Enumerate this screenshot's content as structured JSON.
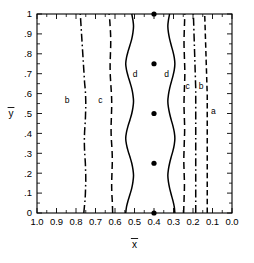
{
  "chart_data": {
    "type": "line",
    "title": "",
    "subtitle": "",
    "xlabel": "x̄",
    "ylabel": "ȳ",
    "xlabel_base": "x",
    "ylabel_base": "y",
    "xlim": [
      1.0,
      0.0
    ],
    "ylim": [
      0.0,
      1.0
    ],
    "x_axis_reversed": true,
    "grid": false,
    "legend": "inline-curve-labels",
    "xticks": [
      1.0,
      0.9,
      0.8,
      0.7,
      0.6,
      0.5,
      0.4,
      0.3,
      0.2,
      0.1,
      0.0
    ],
    "xtick_labels": [
      "1.0",
      "0.9",
      "0.8",
      "0.7",
      "0.6",
      "0.5",
      "0.4",
      "0.3",
      "0.2",
      "0.1",
      "0.0"
    ],
    "yticks": [
      0.0,
      0.1,
      0.2,
      0.3,
      0.4,
      0.5,
      0.6,
      0.7,
      0.8,
      0.9,
      1.0
    ],
    "ytick_labels": [
      "0",
      ".1",
      ".2",
      ".3",
      ".4",
      ".5",
      ".6",
      ".7",
      ".8",
      ".9",
      "1"
    ],
    "annotations": [
      {
        "text": "b",
        "x": 0.845,
        "y": 0.555,
        "name": "curve-label-b-left"
      },
      {
        "text": "c",
        "x": 0.675,
        "y": 0.555,
        "name": "curve-label-c-left"
      },
      {
        "text": "d",
        "x": 0.497,
        "y": 0.685,
        "name": "curve-label-d-left"
      },
      {
        "text": "d",
        "x": 0.335,
        "y": 0.685,
        "name": "curve-label-d-right"
      },
      {
        "text": "c",
        "x": 0.228,
        "y": 0.625,
        "name": "curve-label-c-right"
      },
      {
        "text": "b",
        "x": 0.158,
        "y": 0.625,
        "name": "curve-label-b-right"
      },
      {
        "text": "a",
        "x": 0.095,
        "y": 0.5,
        "name": "curve-label-a-right"
      }
    ],
    "points": {
      "name": "data-points",
      "marker": "filled-circle",
      "x": [
        0.4,
        0.4,
        0.4,
        0.4,
        0.4
      ],
      "y": [
        0.0,
        0.25,
        0.5,
        0.75,
        1.0
      ]
    },
    "series": [
      {
        "name": "b-left",
        "label": "b",
        "style": "dash-dot",
        "x": [
          0.76,
          0.757,
          0.754,
          0.752,
          0.751,
          0.75,
          0.75,
          0.751,
          0.752,
          0.754,
          0.756,
          0.757,
          0.757,
          0.756,
          0.754,
          0.752,
          0.751,
          0.75,
          0.75,
          0.751,
          0.753,
          0.756,
          0.758,
          0.76,
          0.762,
          0.764,
          0.766,
          0.768,
          0.77,
          0.772,
          0.774,
          0.776,
          0.778
        ],
        "y": [
          0.0,
          0.031,
          0.062,
          0.094,
          0.125,
          0.156,
          0.188,
          0.219,
          0.25,
          0.281,
          0.312,
          0.344,
          0.375,
          0.406,
          0.438,
          0.469,
          0.5,
          0.531,
          0.562,
          0.594,
          0.625,
          0.656,
          0.688,
          0.719,
          0.75,
          0.781,
          0.812,
          0.844,
          0.875,
          0.906,
          0.938,
          0.969,
          1.0
        ]
      },
      {
        "name": "c-left",
        "label": "c",
        "style": "dashed",
        "x": [
          0.612,
          0.613,
          0.614,
          0.616,
          0.617,
          0.617,
          0.616,
          0.615,
          0.614,
          0.614,
          0.615,
          0.617,
          0.619,
          0.62,
          0.62,
          0.619,
          0.618,
          0.617,
          0.617,
          0.618,
          0.62,
          0.622,
          0.624,
          0.625,
          0.625,
          0.624,
          0.623,
          0.622,
          0.622,
          0.623,
          0.625,
          0.627,
          0.63
        ],
        "y": [
          0.0,
          0.031,
          0.062,
          0.094,
          0.125,
          0.156,
          0.188,
          0.219,
          0.25,
          0.281,
          0.312,
          0.344,
          0.375,
          0.406,
          0.438,
          0.469,
          0.5,
          0.531,
          0.562,
          0.594,
          0.625,
          0.656,
          0.688,
          0.719,
          0.75,
          0.781,
          0.812,
          0.844,
          0.875,
          0.906,
          0.938,
          0.969,
          1.0
        ]
      },
      {
        "name": "d-left",
        "label": "d",
        "style": "solid",
        "x": [
          0.545,
          0.541,
          0.533,
          0.523,
          0.514,
          0.508,
          0.505,
          0.508,
          0.514,
          0.523,
          0.533,
          0.541,
          0.545,
          0.541,
          0.533,
          0.523,
          0.514,
          0.508,
          0.505,
          0.508,
          0.514,
          0.523,
          0.533,
          0.541,
          0.545,
          0.541,
          0.533,
          0.523,
          0.514,
          0.508,
          0.505,
          0.508,
          0.514
        ],
        "y": [
          0.0,
          0.031,
          0.062,
          0.094,
          0.125,
          0.156,
          0.188,
          0.219,
          0.25,
          0.281,
          0.312,
          0.344,
          0.375,
          0.406,
          0.438,
          0.469,
          0.5,
          0.531,
          0.562,
          0.594,
          0.625,
          0.656,
          0.688,
          0.719,
          0.75,
          0.781,
          0.812,
          0.844,
          0.875,
          0.906,
          0.938,
          0.969,
          1.0
        ]
      },
      {
        "name": "d-right",
        "label": "d",
        "style": "solid",
        "x": [
          0.293,
          0.296,
          0.303,
          0.312,
          0.32,
          0.326,
          0.329,
          0.326,
          0.32,
          0.312,
          0.303,
          0.296,
          0.293,
          0.296,
          0.303,
          0.312,
          0.32,
          0.326,
          0.329,
          0.326,
          0.32,
          0.312,
          0.303,
          0.296,
          0.293,
          0.296,
          0.303,
          0.312,
          0.32,
          0.326,
          0.329,
          0.326,
          0.32
        ],
        "y": [
          0.0,
          0.031,
          0.062,
          0.094,
          0.125,
          0.156,
          0.188,
          0.219,
          0.25,
          0.281,
          0.312,
          0.344,
          0.375,
          0.406,
          0.438,
          0.469,
          0.5,
          0.531,
          0.562,
          0.594,
          0.625,
          0.656,
          0.688,
          0.719,
          0.75,
          0.781,
          0.812,
          0.844,
          0.875,
          0.906,
          0.938,
          0.969,
          1.0
        ]
      },
      {
        "name": "c-right",
        "label": "c",
        "style": "dashed",
        "x": [
          0.248,
          0.247,
          0.246,
          0.245,
          0.244,
          0.244,
          0.245,
          0.246,
          0.247,
          0.247,
          0.246,
          0.245,
          0.244,
          0.243,
          0.243,
          0.244,
          0.245,
          0.246,
          0.246,
          0.245,
          0.244,
          0.243,
          0.242,
          0.242,
          0.243,
          0.244,
          0.245,
          0.246,
          0.246,
          0.245,
          0.244,
          0.243,
          0.242
        ],
        "y": [
          0.0,
          0.031,
          0.062,
          0.094,
          0.125,
          0.156,
          0.188,
          0.219,
          0.25,
          0.281,
          0.312,
          0.344,
          0.375,
          0.406,
          0.438,
          0.469,
          0.5,
          0.531,
          0.562,
          0.594,
          0.625,
          0.656,
          0.688,
          0.719,
          0.75,
          0.781,
          0.812,
          0.844,
          0.875,
          0.906,
          0.938,
          0.969,
          1.0
        ]
      },
      {
        "name": "b-right",
        "label": "b",
        "style": "dash-dot",
        "x": [
          0.186,
          0.186,
          0.186,
          0.186,
          0.186,
          0.186,
          0.186,
          0.186,
          0.186,
          0.186,
          0.186,
          0.186,
          0.186,
          0.186,
          0.186,
          0.186,
          0.186,
          0.186,
          0.186,
          0.186,
          0.186,
          0.187,
          0.188,
          0.189,
          0.19,
          0.191,
          0.192,
          0.193,
          0.194,
          0.195,
          0.196,
          0.197,
          0.198
        ],
        "y": [
          0.0,
          0.031,
          0.062,
          0.094,
          0.125,
          0.156,
          0.188,
          0.219,
          0.25,
          0.281,
          0.312,
          0.344,
          0.375,
          0.406,
          0.438,
          0.469,
          0.5,
          0.531,
          0.562,
          0.594,
          0.625,
          0.656,
          0.688,
          0.719,
          0.75,
          0.781,
          0.812,
          0.844,
          0.875,
          0.906,
          0.938,
          0.969,
          1.0
        ]
      },
      {
        "name": "a-right",
        "label": "a",
        "style": "dashed-fine",
        "x": [
          0.127,
          0.127,
          0.127,
          0.127,
          0.127,
          0.127,
          0.127,
          0.127,
          0.127,
          0.127,
          0.127,
          0.127,
          0.127,
          0.127,
          0.127,
          0.127,
          0.127,
          0.127,
          0.127,
          0.127,
          0.128,
          0.129,
          0.13,
          0.131,
          0.132,
          0.133,
          0.134,
          0.135,
          0.136,
          0.137,
          0.138,
          0.139,
          0.14
        ],
        "y": [
          0.0,
          0.031,
          0.062,
          0.094,
          0.125,
          0.156,
          0.188,
          0.219,
          0.25,
          0.281,
          0.312,
          0.344,
          0.375,
          0.406,
          0.438,
          0.469,
          0.5,
          0.531,
          0.562,
          0.594,
          0.625,
          0.656,
          0.688,
          0.719,
          0.75,
          0.781,
          0.812,
          0.844,
          0.875,
          0.906,
          0.938,
          0.969,
          1.0
        ]
      }
    ]
  },
  "plot_geometry": {
    "left": 37,
    "right": 232,
    "top": 14,
    "bottom": 213
  }
}
